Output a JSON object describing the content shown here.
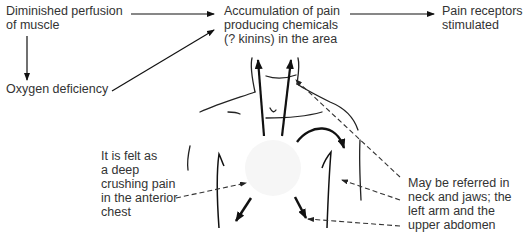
{
  "diagram": {
    "type": "flow-with-body-illustration",
    "nodes": {
      "diminished_perfusion": "Diminished perfusion\nof muscle",
      "oxygen_deficiency": "Oxygen deficiency",
      "accumulation": "Accumulation of pain\nproducing chemicals\n(? kinins) in the area",
      "pain_receptors": "Pain receptors\nstimulated"
    },
    "edges": [
      {
        "from": "diminished_perfusion",
        "to": "accumulation"
      },
      {
        "from": "diminished_perfusion",
        "to": "oxygen_deficiency"
      },
      {
        "from": "oxygen_deficiency",
        "to": "accumulation"
      },
      {
        "from": "accumulation",
        "to": "pain_receptors"
      }
    ],
    "annotations": {
      "anterior_chest": "It is felt as\na deep\ncrushing pain\nin the anterior\nchest",
      "referred": "May be referred in\nneck and jaws; the\nleft arm and the\nupper abdomen"
    }
  }
}
